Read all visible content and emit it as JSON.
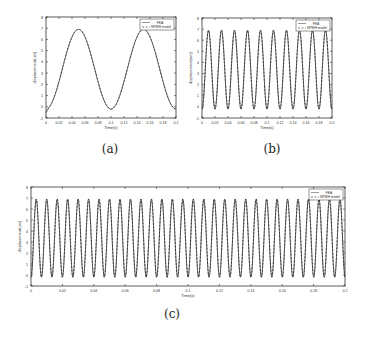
{
  "chart_data": [
    {
      "id": "a",
      "type": "line",
      "caption": "(a)",
      "xlabel": "Time(s)",
      "ylabel": "displacement(um)",
      "xlim": [
        0,
        0.2
      ],
      "ylim": [
        -1,
        8
      ],
      "xticks": [
        "0",
        "0.02",
        "0.04",
        "0.06",
        "0.08",
        "0.1",
        "0.12",
        "0.14",
        "0.16",
        "0.18",
        "0.2"
      ],
      "yticks": [
        "-1",
        "0",
        "1",
        "2",
        "3",
        "4",
        "5",
        "6",
        "7",
        "8"
      ],
      "grid": false,
      "legend": {
        "position": "upper right",
        "entries": [
          "FEA",
          "NPMH model"
        ]
      },
      "series": [
        {
          "name": "FEA",
          "style": "solid",
          "model": "3.35 - 3.55*cos(2*pi*t/0.1)",
          "period": 0.1,
          "min": -0.2,
          "max": 6.9
        },
        {
          "name": "NPMH model",
          "style": "dashed",
          "model": "3.35 - 3.55*cos(2*pi*t/0.1)",
          "period": 0.1,
          "min": -0.2,
          "max": 6.9
        }
      ],
      "x": [
        0,
        0.025,
        0.05,
        0.075,
        0.1,
        0.125,
        0.15,
        0.175,
        0.2
      ],
      "values": [
        -0.2,
        3.35,
        6.9,
        3.35,
        -0.2,
        3.35,
        6.9,
        3.35,
        -0.2
      ]
    },
    {
      "id": "b",
      "type": "line",
      "caption": "(b)",
      "xlabel": "Time(s)",
      "ylabel": "displacement(um)",
      "xlim": [
        0,
        0.2
      ],
      "ylim": [
        -1,
        8
      ],
      "xticks": [
        "0",
        "0.02",
        "0.04",
        "0.06",
        "0.08",
        "0.1",
        "0.12",
        "0.14",
        "0.16",
        "0.18",
        "0.2"
      ],
      "yticks": [
        "-1",
        "0",
        "1",
        "2",
        "3",
        "4",
        "5",
        "6",
        "7",
        "8"
      ],
      "grid": false,
      "legend": {
        "position": "upper right",
        "entries": [
          "FEA",
          "NPMH model"
        ]
      },
      "series": [
        {
          "name": "FEA",
          "style": "solid",
          "period": 0.02,
          "min": -0.2,
          "max": 6.9,
          "peaks": 10
        },
        {
          "name": "NPMH model",
          "style": "dashed",
          "period": 0.02,
          "min": -0.2,
          "max": 6.9,
          "peaks": 10
        }
      ]
    },
    {
      "id": "c",
      "type": "line",
      "caption": "(c)",
      "xlabel": "Time(s)",
      "ylabel": "displacement(um)",
      "xlim": [
        0,
        0.2
      ],
      "ylim": [
        -1,
        8
      ],
      "xticks": [
        "0",
        "0.02",
        "0.04",
        "0.06",
        "0.08",
        "0.1",
        "0.12",
        "0.14",
        "0.16",
        "0.18",
        "0.2"
      ],
      "yticks": [
        "-1",
        "0",
        "1",
        "2",
        "3",
        "4",
        "5",
        "6",
        "7",
        "8"
      ],
      "grid": false,
      "legend": {
        "position": "upper right",
        "entries": [
          "FEA",
          "NPMH model"
        ]
      },
      "series": [
        {
          "name": "FEA",
          "style": "solid",
          "period": 0.00667,
          "min": -0.2,
          "max": 6.9,
          "peaks": 30
        },
        {
          "name": "NPMH model",
          "style": "dashed",
          "period": 0.00667,
          "min": -0.2,
          "max": 6.9,
          "peaks": 30
        }
      ]
    }
  ],
  "captions": {
    "a": "(a)",
    "b": "(b)",
    "c": "(c)"
  }
}
